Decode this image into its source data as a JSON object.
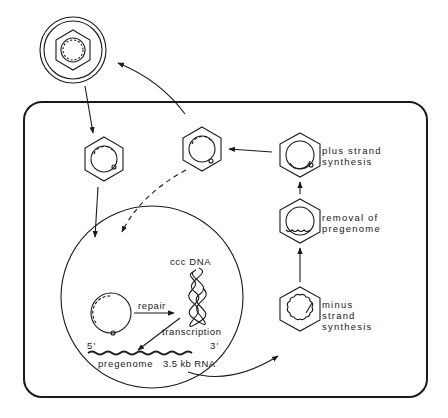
{
  "diagram": {
    "colors": {
      "ink": "#1a1a1a",
      "background": "#ffffff"
    },
    "labels": {
      "plus_strand": [
        "plus strand",
        "synthesis"
      ],
      "removal": [
        "removal of",
        "pregenome"
      ],
      "minus_strand": [
        "minus",
        "strand",
        "synthesis"
      ],
      "ccc_dna": "ccc DNA",
      "repair": "repair",
      "transcription": "transcription",
      "five_prime": "5'",
      "three_prime": "3'",
      "pregenome": "pregenome",
      "rna_size": "3.5 kb RNA"
    },
    "nodes": [
      {
        "id": "extracellular-virion",
        "shape": "enveloped-hexagon"
      },
      {
        "id": "entering-core",
        "shape": "hexagon"
      },
      {
        "id": "mature-core",
        "shape": "hexagon"
      },
      {
        "id": "plus-strand-core",
        "shape": "hexagon"
      },
      {
        "id": "removal-core",
        "shape": "hexagon"
      },
      {
        "id": "minus-strand-core",
        "shape": "hexagon"
      },
      {
        "id": "nucleus",
        "shape": "circle"
      },
      {
        "id": "relaxed-circular-dna",
        "shape": "circle"
      },
      {
        "id": "ccc-dna",
        "shape": "supercoil"
      },
      {
        "id": "pregenome-rna",
        "shape": "wavy-line"
      }
    ]
  }
}
